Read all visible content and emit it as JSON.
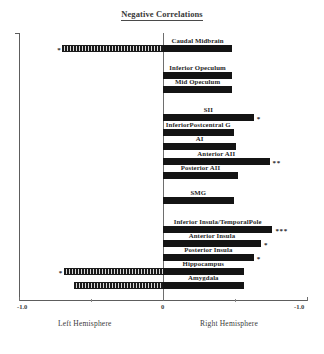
{
  "chart_data": {
    "type": "bar",
    "orientation": "horizontal",
    "title": "Negative Correlations",
    "xlabel": "",
    "ylabel": "",
    "xlim": [
      -1.0,
      1.0
    ],
    "grid": false,
    "legend": null,
    "axis": {
      "tick_labels": [
        "-1.0",
        "0",
        "-1.0"
      ],
      "tick_values": [
        -1.0,
        0,
        1.0
      ],
      "minor_tick_values": [
        -0.5,
        0.5
      ],
      "left_region_label": "Left Hemisphere",
      "right_region_label": "Right Hemisphere",
      "note": "both axis extremes are labelled -1.0; magnitudes of negative correlations plotted outward from centre"
    },
    "series": [
      {
        "name": "Right Hemisphere",
        "style": "solid"
      },
      {
        "name": "Left Hemisphere",
        "style": "hatched"
      }
    ],
    "categories": [
      "Caudal Midbrain",
      "Inferior Opeculum",
      "Mid Opeculum",
      "SII",
      "InferiorPostcentral G",
      "AI",
      "Anterior AII",
      "Posterior AII",
      "SMG",
      "Inferior Insula/TemporalPole",
      "Anterior Insula",
      "Posterior Insula",
      "Hippocampus",
      "Amygdala"
    ],
    "bars": [
      {
        "label": "Caudal Midbrain",
        "right": 0.48,
        "left": 0.7,
        "sig_right": "",
        "sig_left": "*"
      },
      {
        "label": "Inferior Opeculum",
        "right": 0.48,
        "left": 0.0,
        "sig_right": "",
        "sig_left": ""
      },
      {
        "label": "Mid Opeculum",
        "right": 0.48,
        "left": 0.0,
        "sig_right": "",
        "sig_left": ""
      },
      {
        "label": "SII",
        "right": 0.63,
        "left": 0.0,
        "sig_right": "*",
        "sig_left": ""
      },
      {
        "label": "InferiorPostcentral G",
        "right": 0.49,
        "left": 0.0,
        "sig_right": "",
        "sig_left": ""
      },
      {
        "label": "AI",
        "right": 0.51,
        "left": 0.0,
        "sig_right": "",
        "sig_left": ""
      },
      {
        "label": "Anterior AII",
        "right": 0.74,
        "left": 0.0,
        "sig_right": "**",
        "sig_left": ""
      },
      {
        "label": "Posterior AII",
        "right": 0.52,
        "left": 0.0,
        "sig_right": "",
        "sig_left": ""
      },
      {
        "label": "SMG",
        "right": 0.49,
        "left": 0.0,
        "sig_right": "",
        "sig_left": ""
      },
      {
        "label": "Inferior Insula/TemporalPole",
        "right": 0.76,
        "left": 0.0,
        "sig_right": "***",
        "sig_left": ""
      },
      {
        "label": "Anterior Insula",
        "right": 0.68,
        "left": 0.0,
        "sig_right": "*",
        "sig_left": ""
      },
      {
        "label": "Posterior Insula",
        "right": 0.63,
        "left": 0.0,
        "sig_right": "*",
        "sig_left": ""
      },
      {
        "label": "Hippocampus",
        "right": 0.56,
        "left": 0.69,
        "sig_right": "",
        "sig_left": "*"
      },
      {
        "label": "Amygdala",
        "right": 0.56,
        "left": 0.62,
        "sig_right": "",
        "sig_left": ""
      }
    ]
  },
  "colors": {
    "bar_solid": "#141414",
    "bar_hatch": "#1b1b1b",
    "axis": "#5d5d5d",
    "text": "#1f1f1f"
  }
}
